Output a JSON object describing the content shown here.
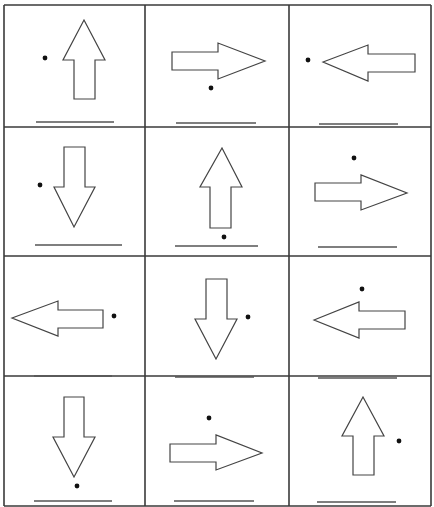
{
  "worksheet": {
    "grid": {
      "columns": 3,
      "rows": 4,
      "col_edges": [
        4,
        145,
        289,
        431
      ],
      "row_edges": [
        5,
        127,
        256,
        376,
        506
      ]
    },
    "colors": {
      "line": "#3a3a3a",
      "arrow_stroke": "#444444",
      "dot": "#111111",
      "answer_line": "#555555"
    },
    "cells": [
      {
        "row": 0,
        "col": 0,
        "arrow": "up",
        "dot": "left"
      },
      {
        "row": 0,
        "col": 1,
        "arrow": "right",
        "dot": "below"
      },
      {
        "row": 0,
        "col": 2,
        "arrow": "left",
        "dot": "left"
      },
      {
        "row": 1,
        "col": 0,
        "arrow": "down",
        "dot": "left"
      },
      {
        "row": 1,
        "col": 1,
        "arrow": "up",
        "dot": "below"
      },
      {
        "row": 1,
        "col": 2,
        "arrow": "right",
        "dot": "above"
      },
      {
        "row": 2,
        "col": 0,
        "arrow": "left",
        "dot": "right"
      },
      {
        "row": 2,
        "col": 1,
        "arrow": "down",
        "dot": "right"
      },
      {
        "row": 2,
        "col": 2,
        "arrow": "left",
        "dot": "above"
      },
      {
        "row": 3,
        "col": 0,
        "arrow": "down",
        "dot": "below"
      },
      {
        "row": 3,
        "col": 1,
        "arrow": "right",
        "dot": "above"
      },
      {
        "row": 3,
        "col": 2,
        "arrow": "up",
        "dot": "right"
      }
    ]
  }
}
